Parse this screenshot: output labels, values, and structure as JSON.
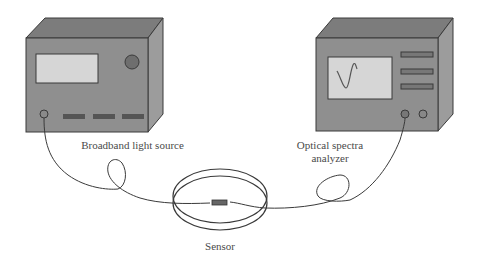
{
  "diagram": {
    "colors": {
      "box_front": "#8f8f8f",
      "box_top": "#7a7a7a",
      "box_side": "#9a9a9a",
      "screen": "#d4d4d4",
      "line": "#3a3a3a",
      "text": "#4a4a4a"
    },
    "components": [
      {
        "id": "light-source",
        "label": "Broadband light source"
      },
      {
        "id": "analyzer",
        "label_line1": "Optical spectra",
        "label_line2": "analyzer"
      },
      {
        "id": "sensor",
        "label": "Sensor"
      }
    ]
  }
}
